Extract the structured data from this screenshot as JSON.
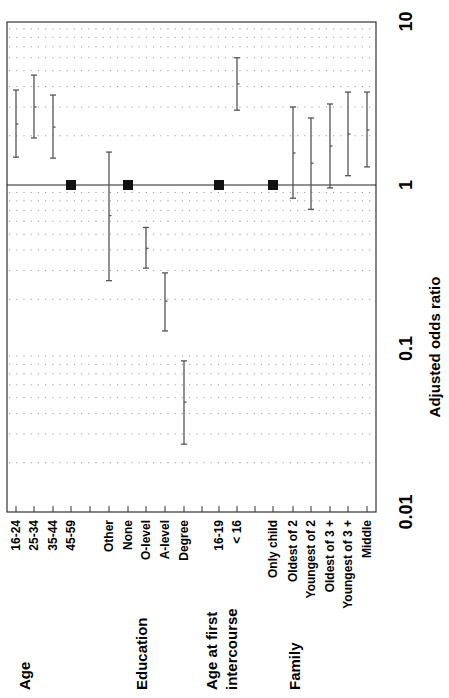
{
  "chart_data": {
    "type": "forest",
    "orientation": "rotated-90",
    "xlabel": "",
    "ylabel": "Adjusted odds ratio",
    "scale": "log",
    "ylim": [
      0.01,
      10
    ],
    "ticks": [
      "0.01",
      "0.1",
      "1",
      "10"
    ],
    "reference_value": 1,
    "groups": [
      {
        "name": "Age",
        "items": [
          {
            "label": "16-24",
            "or": 2.36,
            "lo": 1.48,
            "hi": 3.81
          },
          {
            "label": "25-34",
            "or": 3.0,
            "lo": 1.94,
            "hi": 4.7
          },
          {
            "label": "35-44",
            "or": 2.26,
            "lo": 1.46,
            "hi": 3.55
          },
          {
            "label": "45-59",
            "or": 1,
            "reference": true
          }
        ]
      },
      {
        "name": "Education",
        "items": [
          {
            "label": "Other",
            "or": 0.65,
            "lo": 0.26,
            "hi": 1.59
          },
          {
            "label": "None",
            "or": 1,
            "reference": true
          },
          {
            "label": "O-level",
            "or": 0.41,
            "lo": 0.31,
            "hi": 0.55
          },
          {
            "label": "A-level",
            "or": 0.195,
            "lo": 0.128,
            "hi": 0.29
          },
          {
            "label": "Degree",
            "or": 0.047,
            "lo": 0.026,
            "hi": 0.084
          }
        ]
      },
      {
        "name": "Age at first intercourse",
        "name_lines": [
          "Age at first",
          "intercourse"
        ],
        "items": [
          {
            "label": "16-19",
            "or": 1,
            "reference": true
          },
          {
            "label": "< 16",
            "or": 4.15,
            "lo": 2.87,
            "hi": 6.0
          }
        ]
      },
      {
        "name": "Family",
        "items": [
          {
            "label": "Only child",
            "or": 1,
            "reference": true
          },
          {
            "label": "Oldest of 2",
            "or": 1.57,
            "lo": 0.83,
            "hi": 3.0
          },
          {
            "label": "Youngest of 2",
            "or": 1.36,
            "lo": 0.71,
            "hi": 2.57
          },
          {
            "label": "Oldest of 3 +",
            "or": 1.73,
            "lo": 0.96,
            "hi": 3.13
          },
          {
            "label": "Youngest of 3 +",
            "or": 2.05,
            "lo": 1.14,
            "hi": 3.7
          },
          {
            "label": "Middle",
            "or": 2.17,
            "lo": 1.29,
            "hi": 3.7
          }
        ]
      }
    ],
    "grid": "dotted horizontal at log minor ticks",
    "legend": null
  },
  "layout": {
    "plot": {
      "left": 7,
      "right": 376,
      "top": 22,
      "bottom": 512
    },
    "y_at_1": 185,
    "px_per_decade": 163.5,
    "slots": [
      {
        "group": 0,
        "item": 0,
        "x": 52
      },
      {
        "group": 0,
        "item": 1,
        "x": 71
      },
      {
        "group": 0,
        "item": 2,
        "x": 90
      },
      {
        "group": 0,
        "item": 3,
        "x": 71,
        "dx": 0
      },
      {
        "group": 1,
        "item": 0,
        "x": 109
      },
      {
        "group": 1,
        "item": 1,
        "x": 128
      },
      {
        "group": 1,
        "item": 2,
        "x": 146
      },
      {
        "group": 1,
        "item": 3,
        "x": 165
      },
      {
        "group": 1,
        "item": 4,
        "x": 184
      },
      {
        "group": 2,
        "item": 0,
        "x": 219
      },
      {
        "group": 2,
        "item": 1,
        "x": 237
      },
      {
        "group": 3,
        "item": 0,
        "x": 273
      },
      {
        "group": 3,
        "item": 1,
        "x": 293
      },
      {
        "group": 3,
        "item": 2,
        "x": 311
      },
      {
        "group": 3,
        "item": 3,
        "x": 330
      },
      {
        "group": 3,
        "item": 4,
        "x": 348
      },
      {
        "group": 3,
        "item": 5,
        "x": 367
      }
    ],
    "group_label_x": [
      71,
      146,
      228,
      293
    ],
    "colors": {
      "axis": "#333333",
      "ci": "#555555",
      "grid": "#9a9a9a",
      "ref_marker": "#111111"
    }
  }
}
